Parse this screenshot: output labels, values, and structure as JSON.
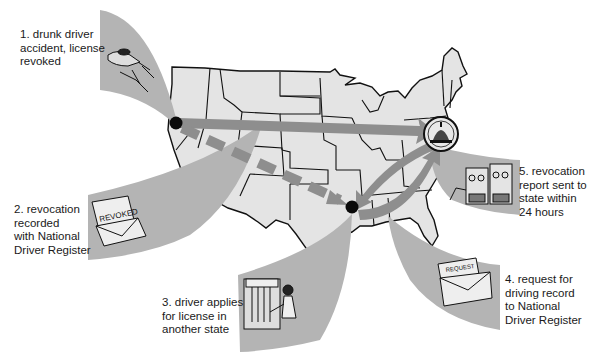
{
  "diagram": {
    "colors": {
      "background": "#ffffff",
      "map_fill": "#e4e4e4",
      "map_stroke": "#111111",
      "wedge": "#b4b4b4",
      "arrow": "#8e8e8e",
      "dot": "#0a0a0a"
    },
    "nodes": [
      {
        "id": "origin-state",
        "desc": "black dot in Oregon",
        "x": 176,
        "y": 123
      },
      {
        "id": "ndr-washington",
        "desc": "Capitol seal in Washington DC",
        "x": 441,
        "y": 134
      },
      {
        "id": "new-state",
        "desc": "black dot in Tennessee/Mississippi",
        "x": 352,
        "y": 207
      }
    ],
    "edges": [
      {
        "from": "origin-state",
        "to": "ndr-washington",
        "style": "solid"
      },
      {
        "from": "origin-state",
        "to": "new-state",
        "style": "dashed"
      },
      {
        "from": "new-state",
        "to": "ndr-washington",
        "style": "solid"
      },
      {
        "from": "ndr-washington",
        "to": "new-state",
        "style": "solid"
      }
    ],
    "steps": [
      {
        "number": "1.",
        "lines": [
          "1.  drunk driver",
          "accident, license",
          "revoked"
        ],
        "icon": "car-crash-icon"
      },
      {
        "number": "2.",
        "lines": [
          "2.  revocation",
          "recorded",
          "with National",
          "Driver Register"
        ],
        "icon": "revoked-envelope-icon",
        "icon_text": "REVOKED"
      },
      {
        "number": "3.",
        "lines": [
          "3.  driver applies",
          "for license in",
          "another state"
        ],
        "icon": "license-window-icon"
      },
      {
        "number": "4.",
        "lines": [
          "4.  request for",
          "driving record",
          "to National",
          "Driver Register"
        ],
        "icon": "request-envelope-icon",
        "icon_text": "REQUEST"
      },
      {
        "number": "5.",
        "lines": [
          "5.  revocation",
          "report sent to",
          "state within",
          "24 hours"
        ],
        "icon": "computer-tapes-icon"
      }
    ]
  }
}
